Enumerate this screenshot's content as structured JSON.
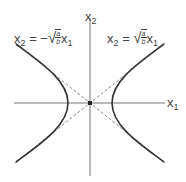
{
  "diagram": {
    "type": "hyperbola-with-asymptotes",
    "axes": {
      "horizontal_label": {
        "base": "x",
        "sub": "1"
      },
      "vertical_label": {
        "base": "x",
        "sub": "2"
      }
    },
    "asymptotes": [
      {
        "label_lhs": {
          "base": "x",
          "sub": "2"
        },
        "eq": "=",
        "sign": "−",
        "frac_num": "a",
        "frac_den": "b",
        "rhs_var": {
          "base": "x",
          "sub": "1"
        }
      },
      {
        "label_lhs": {
          "base": "x",
          "sub": "2"
        },
        "eq": "=",
        "sign": "",
        "frac_num": "a",
        "frac_den": "b",
        "rhs_var": {
          "base": "x",
          "sub": "1"
        }
      }
    ],
    "colors": {
      "axis": "#777777",
      "curve": "#333333",
      "asymptote": "#666666",
      "text": "#444444"
    }
  }
}
